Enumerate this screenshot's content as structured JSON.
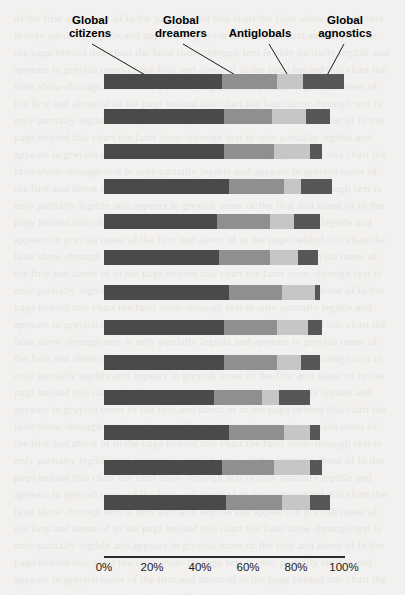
{
  "chart_data": {
    "type": "bar",
    "subtype": "stacked-horizontal-100pct",
    "title": "",
    "xlabel": "",
    "ylabel": "",
    "xlim": [
      0,
      100
    ],
    "xticks": [
      "0%",
      "20%",
      "40%",
      "60%",
      "80%",
      "100%"
    ],
    "xtick_values": [
      0,
      20,
      40,
      60,
      80,
      100
    ],
    "grid": false,
    "legend_position": "top-callouts",
    "series": [
      {
        "name": "Global citizens",
        "color": "#4a4a4a"
      },
      {
        "name": "Global dreamers",
        "color": "#8f8f8f"
      },
      {
        "name": "Antiglobals",
        "color": "#c6c6c6"
      },
      {
        "name": "Global agnostics",
        "color": "#575757"
      }
    ],
    "categories": [
      "Overall average",
      "Brazil",
      "China",
      "Egypt",
      "France",
      "India",
      "Indonesia",
      "Japan",
      "Poland",
      "South Africa",
      "Turkey",
      "UK",
      "US"
    ],
    "values": [
      [
        49,
        23,
        11,
        17
      ],
      [
        50,
        20,
        14,
        10
      ],
      [
        50,
        21,
        15,
        5
      ],
      [
        52,
        23,
        7,
        13
      ],
      [
        47,
        22,
        10,
        11
      ],
      [
        48,
        21,
        12,
        8
      ],
      [
        52,
        22,
        14,
        2
      ],
      [
        50,
        22,
        13,
        6
      ],
      [
        50,
        22,
        10,
        8
      ],
      [
        46,
        20,
        7,
        13
      ],
      [
        52,
        23,
        11,
        4
      ],
      [
        49,
        22,
        15,
        5
      ],
      [
        51,
        23,
        12,
        8
      ]
    ]
  },
  "legend": {
    "items": [
      {
        "label_line1": "Global",
        "label_line2": "citizens"
      },
      {
        "label_line1": "Global",
        "label_line2": "dreamers"
      },
      {
        "label_line1": "",
        "label_line2": "Antiglobals"
      },
      {
        "label_line1": "Global",
        "label_line2": "agnostics"
      }
    ]
  },
  "background_text": "of the first and about of in the page behind this chart the faint show-through text is only partially legible and appears in greyish tones"
}
